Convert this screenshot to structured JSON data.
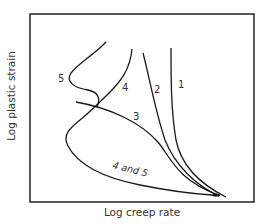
{
  "figure": {
    "axes": {
      "xlabel": "Log creep rate",
      "ylabel": "Log plastic strain"
    },
    "curve_labels": {
      "c1": "1",
      "c2": "2",
      "c3": "3",
      "c4": "4",
      "c5": "5",
      "c45": "4 and 5"
    },
    "colors": {
      "line": "#1a1a1a",
      "frame": "#222222",
      "text": "#333333"
    }
  }
}
